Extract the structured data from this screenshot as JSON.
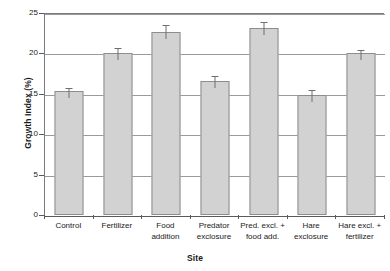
{
  "chart_data": {
    "type": "bar",
    "title": "",
    "xlabel": "Site",
    "ylabel": "Growth Index (%)",
    "ylim": [
      0,
      25
    ],
    "yticks": [
      0,
      5,
      10,
      15,
      20,
      25
    ],
    "ytick_labels": [
      "0",
      "5",
      "10",
      "15",
      "20",
      "25"
    ],
    "grid": true,
    "legend": false,
    "bar_color": "#d2d2d2",
    "bar_edge_color": "#8d8d8d",
    "error_bar_color": "#6e6e6e",
    "error_bar_style": "upper-only-with-cap",
    "categories": [
      "Control",
      "Fertilizer",
      "Food addition",
      "Predator exclosure",
      "Pred. excl. + food add.",
      "Hare exclosure",
      "Hare excl. + fertilizer"
    ],
    "category_label_lines": [
      [
        "Control"
      ],
      [
        "Fertilizer"
      ],
      [
        "Food",
        "addition"
      ],
      [
        "Predator",
        "exclosure"
      ],
      [
        "Pred. excl. +",
        "food add."
      ],
      [
        "Hare",
        "exclosure"
      ],
      [
        "Hare excl. +",
        "fertilizer"
      ]
    ],
    "values": [
      15.4,
      20.0,
      22.6,
      16.6,
      23.2,
      14.9,
      20.0
    ],
    "errors": [
      0.45,
      0.75,
      1.1,
      0.7,
      0.75,
      0.7,
      0.55
    ]
  }
}
